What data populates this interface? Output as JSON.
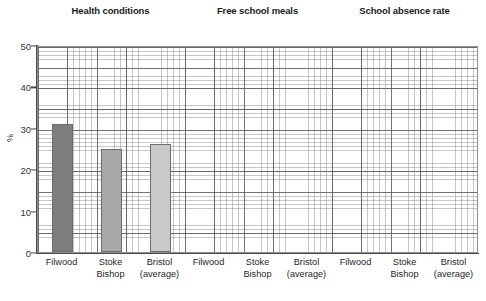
{
  "chart_data": {
    "type": "bar",
    "title": "",
    "xlabel": "",
    "ylabel": "%",
    "ylim": [
      0,
      50
    ],
    "yticks": [
      0,
      10,
      20,
      30,
      40,
      50
    ],
    "grid": "graph-paper minor and major gridlines",
    "legend": "none",
    "groups": [
      {
        "name": "Health conditions",
        "categories": [
          "Filwood",
          "Stoke Bishop",
          "Bristol (average)"
        ],
        "values": [
          31,
          25,
          26
        ]
      },
      {
        "name": "Free school meals",
        "categories": [
          "Filwood",
          "Stoke Bishop",
          "Bristol (average)"
        ],
        "values": [
          null,
          null,
          null
        ]
      },
      {
        "name": "School absence rate",
        "categories": [
          "Filwood",
          "Stoke Bishop",
          "Bristol (average)"
        ],
        "values": [
          null,
          null,
          null
        ]
      }
    ],
    "series": [
      {
        "name": "Filwood",
        "values": [
          31,
          null,
          null
        ],
        "color": "#7d7d7d"
      },
      {
        "name": "Stoke Bishop",
        "values": [
          25,
          null,
          null
        ],
        "color": "#a8a8a8"
      },
      {
        "name": "Bristol (average)",
        "values": [
          26,
          null,
          null
        ],
        "color": "#c9c9c9"
      }
    ]
  },
  "headers": {
    "g0": "Health conditions",
    "g1": "Free school meals",
    "g2": "School absence rate"
  },
  "axis": {
    "y_title": "%",
    "t0": "0",
    "t10": "10",
    "t20": "20",
    "t30": "30",
    "t40": "40",
    "t50": "50"
  },
  "xlabels": {
    "filwood": "Filwood",
    "stoke_l1": "Stoke",
    "stoke_l2": "Bishop",
    "bristol_l1": "Bristol",
    "bristol_l2": "(average)"
  }
}
